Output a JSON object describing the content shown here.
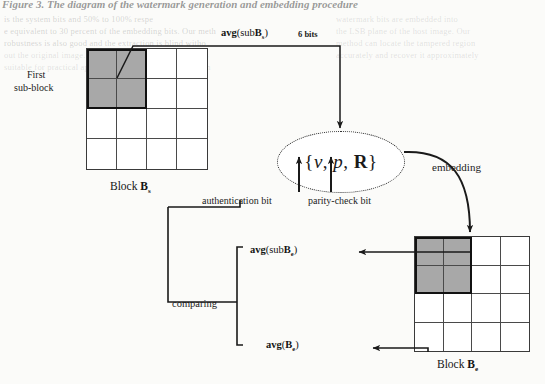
{
  "caption": "Figure 3. The diagram of the watermark generation and embedding procedure",
  "diagram": {
    "type": "flow-diagram",
    "left_block": {
      "label_prefix": "Block ",
      "label_symbol": "B",
      "label_subscript": "s",
      "rows": 4,
      "cols": 4,
      "shaded_rows": 2,
      "shaded_cols": 2,
      "annotation": "First\nsub-block",
      "annotation_line1": "First",
      "annotation_line2": "sub-block"
    },
    "right_block": {
      "label_prefix": "Block ",
      "label_symbol": "B",
      "label_subscript": "e",
      "rows": 4,
      "cols": 4,
      "shaded_rows": 2,
      "shaded_cols": 2
    },
    "center_node": {
      "set_open": "{",
      "item_v": "v",
      "sep1": ", ",
      "item_p": "p",
      "sep2": ", ",
      "item_R": "R",
      "set_close": "}"
    },
    "labels": {
      "top_formula_fn": "avg",
      "top_formula_arg_pre": "(sub",
      "top_formula_arg_sym": "B",
      "top_formula_arg_sub": "s",
      "top_formula_arg_post": ")",
      "top_bits": "6 bits",
      "authentication_bit": "authentication bit",
      "parity_check_bit": "parity-check bit",
      "embedding": "embedding",
      "comparing": "comparing",
      "avg_sub_be_fn": "avg",
      "avg_sub_be_pre": "(sub",
      "avg_sub_be_sym": "B",
      "avg_sub_be_sub": "e",
      "avg_sub_be_post": ")",
      "avg_be_fn": "avg",
      "avg_be_pre": "(",
      "avg_be_sym": "B",
      "avg_be_sub": "e",
      "avg_be_post": ")"
    }
  },
  "background_bleed": {
    "lines": [
      "is the system bits and  50% to 100% respe",
      "e equivalent to 30  percent of the embedding bits. Our   meth",
      "robustness  is also  good  and  the  extraction   is  blind   witho",
      "out  the  original  image.  Therefore  the  proposed   scheme   is",
      "suitable  for  practical  applications  in  image  authentication"
    ],
    "lines_right": [
      "watermark  bits  are  embedded  into",
      "the  LSB  plane  of  the  host  image.  Our",
      "method  can  locate  the  tampered  region",
      "accurately  and  recover  it  approximately"
    ]
  }
}
